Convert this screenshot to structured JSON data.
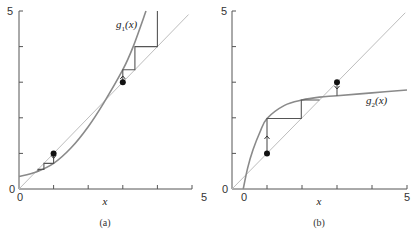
{
  "chart_data": [
    {
      "type": "line",
      "panel_label": "(a)",
      "xlabel": "x",
      "ylabel": "",
      "xlim": [
        0,
        5
      ],
      "ylim": [
        0,
        5
      ],
      "x_tick_labels": [
        "0",
        "5"
      ],
      "y_tick_labels": [
        "0",
        "5"
      ],
      "x_ticks": [
        0,
        1,
        2,
        3,
        4,
        5
      ],
      "y_ticks": [
        0,
        1,
        2,
        3,
        4,
        5
      ],
      "grid": false,
      "series": [
        {
          "name": "y = x",
          "color": "#bdbdbd",
          "points": [
            [
              0,
              0
            ],
            [
              4.9,
              4.9
            ]
          ]
        },
        {
          "name": "g1(x)",
          "color": "#8a8a8a",
          "label": "g",
          "label_sub": "1",
          "label_suffix": "(x)",
          "points": [
            [
              0,
              0.35
            ],
            [
              0.5,
              0.48
            ],
            [
              1,
              0.72
            ],
            [
              1.5,
              1.15
            ],
            [
              2,
              1.75
            ],
            [
              2.45,
              2.42
            ],
            [
              3,
              3.35
            ],
            [
              3.3,
              4.0
            ],
            [
              3.67,
              5.0
            ]
          ]
        }
      ],
      "cobwebs": [
        {
          "start": [
            1,
            1
          ],
          "path": [
            [
              1,
              1
            ],
            [
              1,
              0.72
            ],
            [
              0.72,
              0.72
            ],
            [
              0.72,
              0.55
            ],
            [
              0.55,
              0.55
            ],
            [
              0.55,
              0.5
            ]
          ],
          "arrow": "down"
        },
        {
          "start": [
            3,
            3
          ],
          "path": [
            [
              3,
              3
            ],
            [
              3,
              3.35
            ],
            [
              3.35,
              3.35
            ],
            [
              3.35,
              4.0
            ],
            [
              4.0,
              4.0
            ],
            [
              4.0,
              5.0
            ]
          ],
          "arrow": "up"
        }
      ],
      "fixed_points": [
        [
          0.5,
          0.5
        ],
        [
          2.45,
          2.45
        ]
      ]
    },
    {
      "type": "line",
      "panel_label": "(b)",
      "xlabel": "x",
      "ylabel": "",
      "xlim": [
        0,
        5
      ],
      "ylim": [
        0,
        5
      ],
      "x_tick_labels": [
        "0",
        "5"
      ],
      "y_tick_labels": [
        "0",
        "5"
      ],
      "x_ticks": [
        0,
        1,
        2,
        3,
        4,
        5
      ],
      "y_ticks": [
        0,
        1,
        2,
        3,
        4,
        5
      ],
      "extra_x_label": {
        "x": 0.3,
        "text": "0"
      },
      "grid": false,
      "series": [
        {
          "name": "y = x",
          "color": "#bdbdbd",
          "points": [
            [
              0,
              0
            ],
            [
              4.95,
              4.95
            ]
          ]
        },
        {
          "name": "g2(x)",
          "color": "#8a8a8a",
          "label": "g",
          "label_sub": "2",
          "label_suffix": "(x)",
          "points": [
            [
              0.32,
              0
            ],
            [
              0.45,
              0.6
            ],
            [
              0.6,
              1.1
            ],
            [
              0.8,
              1.6
            ],
            [
              1,
              1.98
            ],
            [
              1.5,
              2.35
            ],
            [
              2,
              2.5
            ],
            [
              2.5,
              2.58
            ],
            [
              3,
              2.62
            ],
            [
              4,
              2.7
            ],
            [
              5,
              2.78
            ]
          ]
        }
      ],
      "cobwebs": [
        {
          "start": [
            1,
            1
          ],
          "path": [
            [
              1,
              1
            ],
            [
              1,
              1.98
            ],
            [
              1.98,
              1.98
            ],
            [
              1.98,
              2.5
            ],
            [
              2.5,
              2.5
            ]
          ],
          "arrow": "up"
        },
        {
          "start": [
            3,
            3
          ],
          "path": [
            [
              3,
              3
            ],
            [
              3,
              2.62
            ]
          ],
          "arrow": "down"
        }
      ],
      "fixed_points": [
        [
          2.6,
          2.6
        ]
      ]
    }
  ],
  "panels": {
    "a": {
      "label": "(a)",
      "xlabel": "x",
      "y_top": "5",
      "y_origin": "0",
      "x_origin": "0",
      "x_end": "5",
      "fn_name": "g",
      "fn_sub": "1",
      "fn_args": "(x)"
    },
    "b": {
      "label": "(b)",
      "xlabel": "x",
      "y_top": "5",
      "y_origin": "0",
      "x_origin": "0",
      "x_end": "5",
      "fn_name": "g",
      "fn_sub": "2",
      "fn_args": "(x)"
    }
  }
}
